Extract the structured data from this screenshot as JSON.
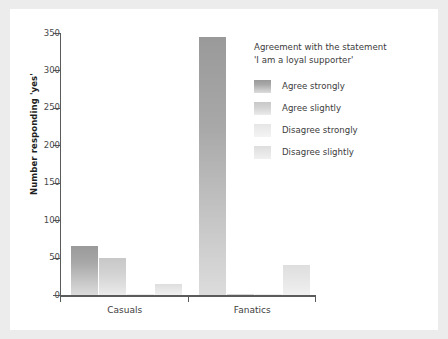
{
  "chart_data": {
    "type": "bar",
    "title": "",
    "xlabel": "",
    "ylabel": "Number responding 'yes'",
    "ylim": [
      0,
      350
    ],
    "yticks": [
      0,
      50,
      100,
      150,
      200,
      250,
      300,
      350
    ],
    "ytick_labels": [
      "0",
      "50",
      "100",
      "150",
      "200",
      "250",
      "300",
      "350"
    ],
    "categories": [
      "Casuals",
      "Fanatics"
    ],
    "grid": false,
    "legend_position": "right",
    "legend_title_lines": [
      "Agreement with the statement",
      "'I am a loyal supporter'"
    ],
    "series": [
      {
        "name": "Agree strongly",
        "values": [
          65,
          345
        ],
        "color": "#a0a0a0"
      },
      {
        "name": "Agree slightly",
        "values": [
          50,
          1
        ],
        "color": "#d0d0d0"
      },
      {
        "name": "Disagree strongly",
        "values": [
          2,
          2
        ],
        "color": "#ededed"
      },
      {
        "name": "Disagree slightly",
        "values": [
          15,
          40
        ],
        "color": "#e4e4e4"
      }
    ]
  },
  "colors": {
    "page_background": "#ececed",
    "card_background": "#ffffff",
    "axis": "#5b5b5b",
    "tick_text": "#4a4a4a",
    "label_text": "#3b3b3b"
  }
}
